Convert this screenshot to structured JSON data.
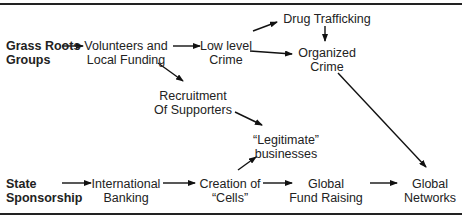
{
  "diagram": {
    "sources": {
      "grass_roots": [
        "Grass Roots",
        "Groups"
      ],
      "state": [
        "State",
        "Sponsorship"
      ]
    },
    "nodes": {
      "volunteers": [
        "Volunteers and",
        "Local Funding"
      ],
      "low_level": [
        "Low level",
        "Crime"
      ],
      "drug": [
        "Drug Trafficking"
      ],
      "organized": [
        "Organized",
        "Crime"
      ],
      "recruitment": [
        "Recruitment",
        "Of Supporters"
      ],
      "legitimate": [
        "“Legitimate”",
        "businesses"
      ],
      "intl_banking": [
        "International",
        "Banking"
      ],
      "cells": [
        "Creation of",
        "“Cells”"
      ],
      "fund_raising": [
        "Global",
        "Fund Raising"
      ],
      "networks": [
        "Global",
        "Networks"
      ]
    },
    "edges": [
      [
        "grass_roots",
        "volunteers"
      ],
      [
        "volunteers",
        "low_level"
      ],
      [
        "volunteers",
        "recruitment"
      ],
      [
        "low_level",
        "drug"
      ],
      [
        "low_level",
        "organized"
      ],
      [
        "drug",
        "organized"
      ],
      [
        "recruitment",
        "legitimate"
      ],
      [
        "organized",
        "networks"
      ],
      [
        "state",
        "intl_banking"
      ],
      [
        "intl_banking",
        "cells"
      ],
      [
        "cells",
        "legitimate"
      ],
      [
        "cells",
        "fund_raising"
      ],
      [
        "fund_raising",
        "networks"
      ]
    ]
  }
}
